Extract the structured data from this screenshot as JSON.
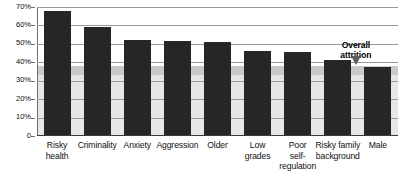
{
  "chart_data": {
    "type": "bar",
    "title": "",
    "xlabel": "",
    "ylabel": "",
    "ylim": [
      0,
      70
    ],
    "grid": true,
    "legend": "none",
    "categories": [
      "Risky health",
      "Criminality",
      "Anxiety",
      "Aggression",
      "Older",
      "Low grades",
      "Poor self-regulation",
      "Risky family background",
      "Male"
    ],
    "category_lines": [
      [
        "Risky",
        "health"
      ],
      [
        "Criminality"
      ],
      [
        "Anxiety"
      ],
      [
        "Aggression"
      ],
      [
        "Older"
      ],
      [
        "Low",
        "grades"
      ],
      [
        "Poor",
        "self-",
        "regulation"
      ],
      [
        "Risky family",
        "background"
      ],
      [
        "Male"
      ]
    ],
    "values": [
      68,
      59,
      52,
      51.5,
      51,
      46,
      45.5,
      41.5,
      37.5
    ],
    "ytick_labels": [
      "70%",
      "60%",
      "50%",
      "40%",
      "30%",
      "20%",
      "10%",
      "0"
    ],
    "ytick_values": [
      70,
      60,
      50,
      40,
      30,
      20,
      10,
      0
    ],
    "annotations": [
      {
        "name": "overall-attrition",
        "lines": [
          "Overall",
          "attrition"
        ],
        "text": "Overall attrition",
        "value": 38
      }
    ],
    "reference_band": {
      "label": "Overall attrition",
      "upper": 38,
      "lower": 33,
      "base": 0
    },
    "colors": {
      "bar": "#262626",
      "band_upper": "#c9c9c9",
      "band_lower": "#e6e6e6",
      "grid": "#9a9a9a",
      "axis": "#3a3a3a",
      "text": "#111111",
      "pointer": "#5e5e5e"
    }
  }
}
